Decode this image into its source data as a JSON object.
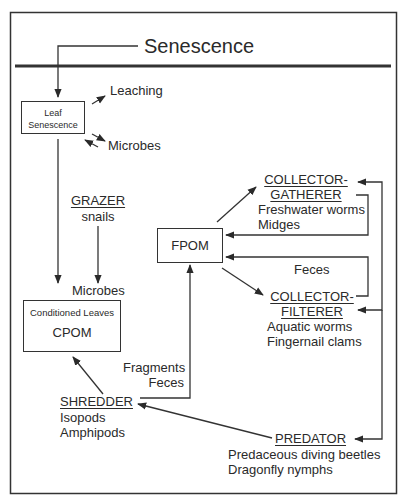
{
  "title": "Senescence",
  "nodes": {
    "leaf_senescence": {
      "lines": [
        "Leaf",
        "Senescence"
      ]
    },
    "leaching": {
      "label": "Leaching"
    },
    "microbes_top": {
      "label": "Microbes"
    },
    "grazer": {
      "heading": "GRAZER",
      "members": [
        "snails"
      ]
    },
    "microbes_mid": {
      "label": "Microbes"
    },
    "cpom": {
      "subtitle": "Conditioned Leaves",
      "label": "CPOM"
    },
    "fpom": {
      "label": "FPOM"
    },
    "collector_gatherer": {
      "heading": [
        "COLLECTOR-",
        "GATHERER"
      ],
      "members": [
        "Freshwater worms",
        "Midges"
      ]
    },
    "feces_mid": {
      "label": "Feces"
    },
    "collector_filterer": {
      "heading": [
        "COLLECTOR-",
        "FILTERER"
      ],
      "members": [
        "Aquatic worms",
        "Fingernail clams"
      ]
    },
    "fragments_feces": {
      "lines": [
        "Fragments",
        "Feces"
      ]
    },
    "shredder": {
      "heading": "SHREDDER",
      "members": [
        "Isopods",
        "Amphipods"
      ]
    },
    "predator": {
      "heading": "PREDATOR",
      "members": [
        "Predaceous diving beetles",
        "Dragonfly nymphs"
      ]
    }
  },
  "edges": [
    {
      "from": "Senescence",
      "to": "Leaf Senescence"
    },
    {
      "from": "Leaf Senescence",
      "to": "Leaching"
    },
    {
      "from": "Leaf Senescence",
      "to": "Microbes"
    },
    {
      "from": "Microbes",
      "to": "Leaf Senescence"
    },
    {
      "from": "Leaf Senescence",
      "to": "Microbes (CPOM)"
    },
    {
      "from": "GRAZER",
      "to": "Microbes (CPOM)"
    },
    {
      "from": "SHREDDER",
      "to": "CPOM"
    },
    {
      "from": "SHREDDER",
      "to": "FPOM",
      "label": "Fragments / Feces"
    },
    {
      "from": "FPOM",
      "to": "COLLECTOR-GATHERER"
    },
    {
      "from": "COLLECTOR-GATHERER",
      "to": "FPOM"
    },
    {
      "from": "COLLECTOR-FILTERER",
      "to": "FPOM",
      "label": "Feces"
    },
    {
      "from": "FPOM",
      "to": "COLLECTOR-FILTERER"
    },
    {
      "from": "PREDATOR",
      "to": "SHREDDER"
    },
    {
      "from": "PREDATOR",
      "to": "COLLECTOR-GATHERER"
    },
    {
      "from": "PREDATOR",
      "to": "COLLECTOR-FILTERER"
    }
  ],
  "colors": {
    "ink": "#2a2a2a",
    "line": "#333333",
    "background": "#ffffff"
  }
}
